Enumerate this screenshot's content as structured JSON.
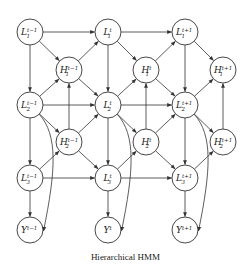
{
  "diagram": {
    "caption": "Hierarchical HMM",
    "node_radius": 13,
    "nodes": [
      {
        "id": "L1_tm1",
        "base": "L",
        "sub": "1",
        "sup": "t−1",
        "x": 30,
        "y": 32
      },
      {
        "id": "L1_t",
        "base": "L",
        "sub": "1",
        "sup": "t",
        "x": 108,
        "y": 32
      },
      {
        "id": "L1_tp1",
        "base": "L",
        "sub": "1",
        "sup": "t+1",
        "x": 185,
        "y": 32
      },
      {
        "id": "H1_tm1",
        "base": "H",
        "sub": "1",
        "sup": "t−1",
        "x": 69,
        "y": 70
      },
      {
        "id": "H1_t",
        "base": "H",
        "sub": "1",
        "sup": "t",
        "x": 146,
        "y": 70
      },
      {
        "id": "H1_tp1",
        "base": "H",
        "sub": "1",
        "sup": "t+1",
        "x": 223,
        "y": 70
      },
      {
        "id": "L2_tm1",
        "base": "L",
        "sub": "2",
        "sup": "t−1",
        "x": 30,
        "y": 105
      },
      {
        "id": "L2_t",
        "base": "L",
        "sub": "2",
        "sup": "t",
        "x": 108,
        "y": 105
      },
      {
        "id": "L2_tp1",
        "base": "L",
        "sub": "2",
        "sup": "t+1",
        "x": 185,
        "y": 105
      },
      {
        "id": "H2_tm1",
        "base": "H",
        "sub": "2",
        "sup": "t−1",
        "x": 69,
        "y": 142
      },
      {
        "id": "H2_t",
        "base": "H",
        "sub": "2",
        "sup": "t",
        "x": 146,
        "y": 142
      },
      {
        "id": "H2_tp1",
        "base": "H",
        "sub": "2",
        "sup": "t+1",
        "x": 223,
        "y": 142
      },
      {
        "id": "L3_tm1",
        "base": "L",
        "sub": "3",
        "sup": "t−1",
        "x": 30,
        "y": 178
      },
      {
        "id": "L3_t",
        "base": "L",
        "sub": "3",
        "sup": "t",
        "x": 108,
        "y": 178
      },
      {
        "id": "L3_tp1",
        "base": "L",
        "sub": "3",
        "sup": "t+1",
        "x": 185,
        "y": 178
      },
      {
        "id": "Y_tm1",
        "base": "Y",
        "sub": "",
        "sup": "t−1",
        "x": 30,
        "y": 230
      },
      {
        "id": "Y_t",
        "base": "Y",
        "sub": "",
        "sup": "t",
        "x": 108,
        "y": 230
      },
      {
        "id": "Y_tp1",
        "base": "Y",
        "sub": "",
        "sup": "t+1",
        "x": 185,
        "y": 230
      }
    ],
    "edges": [
      [
        "L1_tm1",
        "L1_t"
      ],
      [
        "L1_t",
        "L1_tp1"
      ],
      [
        "L2_tm1",
        "L2_t"
      ],
      [
        "L2_t",
        "L2_tp1"
      ],
      [
        "L3_tm1",
        "L3_t"
      ],
      [
        "L3_t",
        "L3_tp1"
      ],
      [
        "L1_tm1",
        "L2_tm1"
      ],
      [
        "L2_tm1",
        "L3_tm1"
      ],
      [
        "L3_tm1",
        "Y_tm1"
      ],
      [
        "L1_t",
        "L2_t"
      ],
      [
        "L2_t",
        "L3_t"
      ],
      [
        "L3_t",
        "Y_t"
      ],
      [
        "L1_tp1",
        "L2_tp1"
      ],
      [
        "L2_tp1",
        "L3_tp1"
      ],
      [
        "L3_tp1",
        "Y_tp1"
      ],
      [
        "L1_tm1",
        "H1_tm1"
      ],
      [
        "H1_tm1",
        "L1_t"
      ],
      [
        "L2_tm1",
        "H1_tm1"
      ],
      [
        "H1_tm1",
        "L2_t"
      ],
      [
        "L1_t",
        "H1_t"
      ],
      [
        "H1_t",
        "L1_tp1"
      ],
      [
        "L2_t",
        "H1_t"
      ],
      [
        "H1_t",
        "L2_tp1"
      ],
      [
        "L1_tp1",
        "H1_tp1"
      ],
      [
        "L2_tp1",
        "H1_tp1"
      ],
      [
        "L2_tm1",
        "H2_tm1"
      ],
      [
        "H2_tm1",
        "L2_t"
      ],
      [
        "L3_tm1",
        "H2_tm1"
      ],
      [
        "H2_tm1",
        "L3_t"
      ],
      [
        "L2_t",
        "H2_t"
      ],
      [
        "H2_t",
        "L2_tp1"
      ],
      [
        "L3_t",
        "H2_t"
      ],
      [
        "H2_t",
        "L3_tp1"
      ],
      [
        "L2_tp1",
        "H2_tp1"
      ],
      [
        "L3_tp1",
        "H2_tp1"
      ],
      [
        "H2_tm1",
        "H1_tm1"
      ],
      [
        "H2_t",
        "H1_t"
      ],
      [
        "H2_tp1",
        "H1_tp1"
      ]
    ],
    "curved_edges": [
      [
        "L2_tm1",
        "Y_tm1"
      ],
      [
        "L2_t",
        "Y_t"
      ],
      [
        "L2_tp1",
        "Y_tp1"
      ]
    ]
  }
}
